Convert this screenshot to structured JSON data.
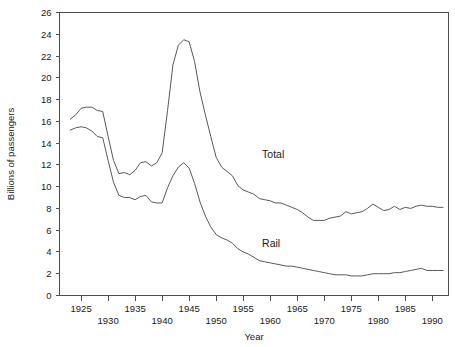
{
  "chart_data": {
    "type": "line",
    "title": "",
    "subtitle": "",
    "xlabel": "Year",
    "ylabel": "Billions of passengers",
    "xlim": [
      1921,
      1993
    ],
    "ylim": [
      0,
      26
    ],
    "grid": false,
    "legend_position": "inline-annotation",
    "y_ticks": [
      0,
      2,
      4,
      6,
      8,
      10,
      12,
      14,
      16,
      18,
      20,
      22,
      24,
      26
    ],
    "y_ticklabels": [
      "0",
      "2",
      "4",
      "6",
      "8",
      "10",
      "12",
      "14",
      "16",
      "18",
      "20",
      "22",
      "24",
      "26"
    ],
    "x_ticks": [
      1925,
      1930,
      1935,
      1940,
      1945,
      1950,
      1955,
      1960,
      1965,
      1970,
      1975,
      1980,
      1985,
      1990
    ],
    "x_ticklabels_upper": [
      "1925",
      "1935",
      "1945",
      "1955",
      "1965",
      "1975",
      "1985"
    ],
    "x_ticklabels_lower": [
      "1930",
      "1940",
      "1950",
      "1960",
      "1970",
      "1980",
      "1990"
    ],
    "annotations": [
      {
        "text": "Total",
        "x": 1958.5,
        "y": 13.0
      },
      {
        "text": "Rail",
        "x": 1958.5,
        "y": 4.8
      }
    ],
    "series": [
      {
        "name": "Total",
        "label": "Total",
        "color": "#595959",
        "x": [
          1923,
          1924,
          1925,
          1926,
          1927,
          1928,
          1929,
          1930,
          1931,
          1932,
          1933,
          1934,
          1935,
          1936,
          1937,
          1938,
          1939,
          1940,
          1941,
          1942,
          1943,
          1944,
          1945,
          1946,
          1947,
          1948,
          1949,
          1950,
          1951,
          1952,
          1953,
          1954,
          1955,
          1956,
          1957,
          1958,
          1959,
          1960,
          1961,
          1962,
          1963,
          1964,
          1965,
          1966,
          1967,
          1968,
          1969,
          1970,
          1971,
          1972,
          1973,
          1974,
          1975,
          1976,
          1977,
          1978,
          1979,
          1980,
          1981,
          1982,
          1983,
          1984,
          1985,
          1986,
          1987,
          1988,
          1989,
          1990,
          1991,
          1992
        ],
        "y": [
          16.2,
          16.6,
          17.2,
          17.3,
          17.3,
          17.0,
          16.9,
          14.6,
          12.4,
          11.2,
          11.3,
          11.1,
          11.5,
          12.2,
          12.3,
          11.9,
          12.2,
          13.1,
          17.0,
          21.2,
          23.0,
          23.5,
          23.3,
          21.5,
          18.7,
          16.6,
          14.6,
          12.7,
          11.8,
          11.4,
          11.0,
          10.1,
          9.7,
          9.5,
          9.3,
          8.9,
          8.8,
          8.7,
          8.5,
          8.5,
          8.3,
          8.1,
          7.9,
          7.6,
          7.2,
          6.9,
          6.9,
          6.9,
          7.1,
          7.2,
          7.3,
          7.7,
          7.5,
          7.6,
          7.7,
          8.0,
          8.4,
          8.1,
          7.8,
          7.9,
          8.2,
          7.9,
          8.1,
          8.0,
          8.2,
          8.3,
          8.2,
          8.2,
          8.1,
          8.1
        ]
      },
      {
        "name": "Rail",
        "label": "Rail",
        "color": "#595959",
        "x": [
          1923,
          1924,
          1925,
          1926,
          1927,
          1928,
          1929,
          1930,
          1931,
          1932,
          1933,
          1934,
          1935,
          1936,
          1937,
          1938,
          1939,
          1940,
          1941,
          1942,
          1943,
          1944,
          1945,
          1946,
          1947,
          1948,
          1949,
          1950,
          1951,
          1952,
          1953,
          1954,
          1955,
          1956,
          1957,
          1958,
          1959,
          1960,
          1961,
          1962,
          1963,
          1964,
          1965,
          1966,
          1967,
          1968,
          1969,
          1970,
          1971,
          1972,
          1973,
          1974,
          1975,
          1976,
          1977,
          1978,
          1979,
          1980,
          1981,
          1982,
          1983,
          1984,
          1985,
          1986,
          1987,
          1988,
          1989,
          1990,
          1991,
          1992
        ],
        "y": [
          15.2,
          15.4,
          15.5,
          15.4,
          15.1,
          14.6,
          14.5,
          12.4,
          10.4,
          9.2,
          9.0,
          9.0,
          8.8,
          9.1,
          9.2,
          8.6,
          8.5,
          8.5,
          9.9,
          11.0,
          11.8,
          12.2,
          11.7,
          10.3,
          8.6,
          7.3,
          6.3,
          5.6,
          5.3,
          5.1,
          4.8,
          4.3,
          4.0,
          3.8,
          3.5,
          3.2,
          3.1,
          3.0,
          2.9,
          2.8,
          2.7,
          2.7,
          2.6,
          2.5,
          2.4,
          2.3,
          2.2,
          2.1,
          2.0,
          1.9,
          1.9,
          1.9,
          1.8,
          1.8,
          1.8,
          1.9,
          2.0,
          2.0,
          2.0,
          2.0,
          2.1,
          2.1,
          2.2,
          2.3,
          2.4,
          2.5,
          2.3,
          2.3,
          2.3,
          2.3
        ]
      }
    ]
  }
}
